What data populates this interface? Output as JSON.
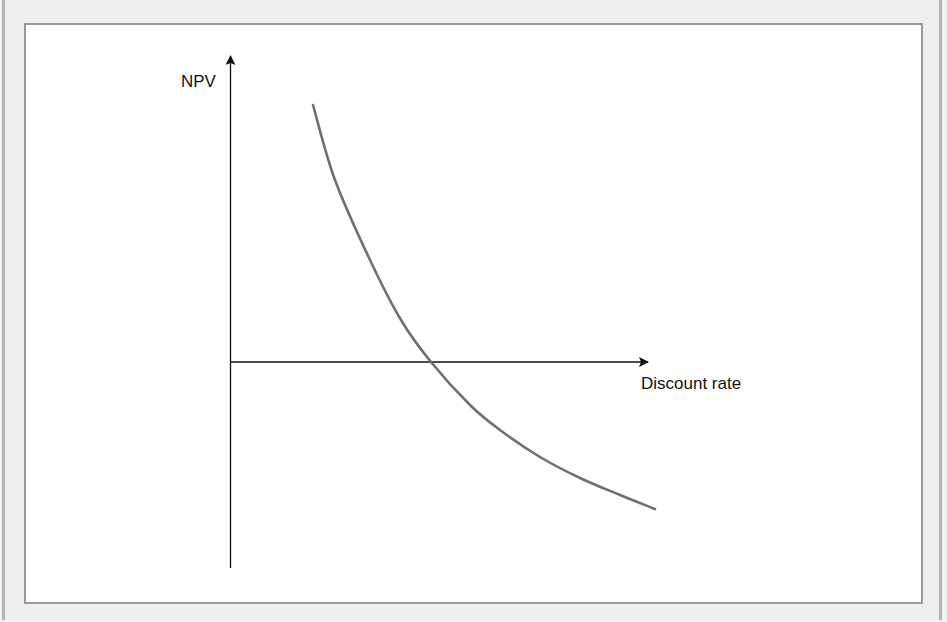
{
  "chart_data": {
    "type": "line",
    "title": "",
    "xlabel": "Discount rate",
    "ylabel": "NPV",
    "grid": false,
    "legend": null,
    "series": [
      {
        "name": "NPV profile",
        "color": "#707070",
        "description": "Downward-sloping convex curve; NPV decreases as discount rate increases, crossing zero (the IRR) and becoming negative",
        "points_px": [
          [
            313,
            105
          ],
          [
            335,
            180
          ],
          [
            370,
            260
          ],
          [
            401,
            320
          ],
          [
            431,
            362
          ],
          [
            470,
            405
          ],
          [
            500,
            430
          ],
          [
            540,
            457
          ],
          [
            580,
            478
          ],
          [
            620,
            495
          ],
          [
            655,
            509
          ]
        ]
      }
    ],
    "annotations": [],
    "axes": {
      "origin_px": [
        230,
        362
      ],
      "x_arrow_end_px": [
        648,
        362
      ],
      "y_arrow_end_px": [
        231,
        55
      ],
      "y_axis_bottom_px": [
        230,
        568
      ],
      "tick_labels": false
    }
  },
  "labels": {
    "y_axis": "NPV",
    "x_axis": "Discount rate"
  }
}
